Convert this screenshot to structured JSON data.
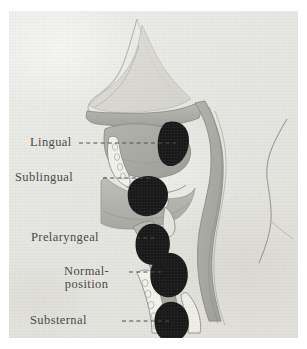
{
  "figure": {
    "paper_color": "#e9e9e6",
    "ink_color": "#4a4a48",
    "mass_color": "#181818",
    "tissue_color": "#a9a9a4",
    "outline_color": "#8a8a85"
  },
  "labels": [
    {
      "id": "lingual",
      "text": "Lingual",
      "text2": ""
    },
    {
      "id": "sublingual",
      "text": "Sublingual",
      "text2": ""
    },
    {
      "id": "prelaryngeal",
      "text": "Prelaryngeal",
      "text2": ""
    },
    {
      "id": "normal",
      "text": "Normal-",
      "text2": "position"
    },
    {
      "id": "substernal",
      "text": "Substernal",
      "text2": ""
    }
  ],
  "diagram_parts": {
    "nasal_cavity": "nasal-cavity",
    "hard_palate": "hard-palate",
    "tongue": "tongue",
    "mandible_teeth": "mandible-with-teeth",
    "hyoid": "hyoid-bone",
    "epiglottis": "epiglottis",
    "pharynx": "pharyngeal-airway",
    "trachea": "trachea",
    "vertebrae": "cervical-vertebrae",
    "sternum": "sternum",
    "neck_contour": "posterior-neck-contour"
  },
  "thyroid_positions": [
    {
      "id": "mass-lingual",
      "label": "Lingual"
    },
    {
      "id": "mass-sublingual",
      "label": "Sublingual"
    },
    {
      "id": "mass-prelaryngeal",
      "label": "Prelaryngeal"
    },
    {
      "id": "mass-normal",
      "label": "Normal position"
    },
    {
      "id": "mass-substernal",
      "label": "Substernal"
    }
  ]
}
